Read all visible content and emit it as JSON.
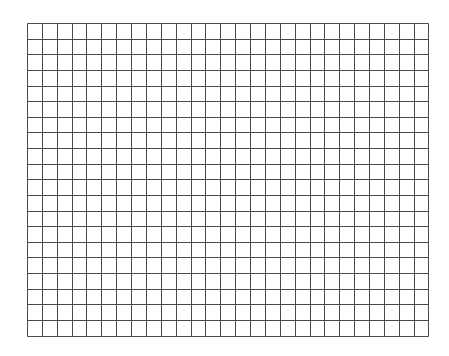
{
  "grid": {
    "columns": 27,
    "rows": 20,
    "cell_width": 14.87,
    "cell_height": 15.63,
    "line_color": "#4a4a4a",
    "background_color": "#ffffff"
  }
}
